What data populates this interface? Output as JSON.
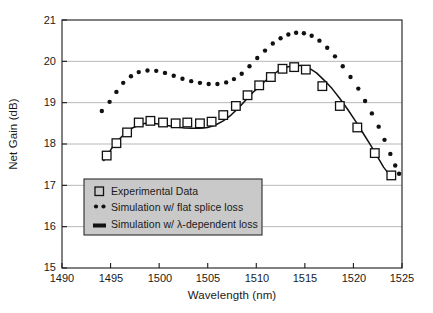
{
  "chart_data": {
    "type": "line",
    "title": "",
    "xlabel": "Wavelength (nm)",
    "ylabel": "Net Gain (dB)",
    "xlim": [
      1490,
      1525
    ],
    "ylim": [
      15,
      21
    ],
    "xticks": [
      1490,
      1495,
      1500,
      1505,
      1510,
      1515,
      1520,
      1525
    ],
    "yticks": [
      15,
      16,
      17,
      18,
      19,
      20,
      21
    ],
    "grid": "horizontal",
    "legend_position": "lower-left-inside",
    "series": [
      {
        "name": "Experimental Data",
        "marker": "open-square",
        "style": "markers",
        "points": [
          [
            1494.6,
            17.72
          ],
          [
            1495.6,
            18.02
          ],
          [
            1496.7,
            18.28
          ],
          [
            1497.9,
            18.52
          ],
          [
            1499.1,
            18.56
          ],
          [
            1500.4,
            18.52
          ],
          [
            1501.7,
            18.5
          ],
          [
            1502.9,
            18.52
          ],
          [
            1504.2,
            18.5
          ],
          [
            1505.4,
            18.54
          ],
          [
            1506.6,
            18.7
          ],
          [
            1507.9,
            18.92
          ],
          [
            1509.1,
            19.18
          ],
          [
            1510.3,
            19.42
          ],
          [
            1511.5,
            19.62
          ],
          [
            1512.7,
            19.82
          ],
          [
            1513.9,
            19.86
          ],
          [
            1515.1,
            19.8
          ],
          [
            1516.8,
            19.4
          ],
          [
            1518.6,
            18.92
          ],
          [
            1520.4,
            18.4
          ],
          [
            1522.2,
            17.78
          ],
          [
            1523.9,
            17.24
          ]
        ]
      },
      {
        "name": "Simulation w/ flat splice loss",
        "marker": "dot",
        "style": "dotted",
        "points": [
          [
            1494.1,
            18.8
          ],
          [
            1494.9,
            19.02
          ],
          [
            1495.6,
            19.26
          ],
          [
            1496.3,
            19.48
          ],
          [
            1497.1,
            19.64
          ],
          [
            1497.9,
            19.74
          ],
          [
            1498.8,
            19.78
          ],
          [
            1499.7,
            19.77
          ],
          [
            1500.6,
            19.72
          ],
          [
            1501.5,
            19.65
          ],
          [
            1502.4,
            19.58
          ],
          [
            1503.3,
            19.52
          ],
          [
            1504.2,
            19.48
          ],
          [
            1505.1,
            19.45
          ],
          [
            1506.0,
            19.45
          ],
          [
            1506.9,
            19.49
          ],
          [
            1507.7,
            19.57
          ],
          [
            1508.5,
            19.7
          ],
          [
            1509.3,
            19.88
          ],
          [
            1510.1,
            20.08
          ],
          [
            1510.9,
            20.26
          ],
          [
            1511.7,
            20.43
          ],
          [
            1512.5,
            20.56
          ],
          [
            1513.3,
            20.65
          ],
          [
            1514.1,
            20.69
          ],
          [
            1514.9,
            20.68
          ],
          [
            1515.7,
            20.62
          ],
          [
            1516.5,
            20.5
          ],
          [
            1517.3,
            20.33
          ],
          [
            1518.1,
            20.12
          ],
          [
            1518.9,
            19.88
          ],
          [
            1519.7,
            19.62
          ],
          [
            1520.5,
            19.34
          ],
          [
            1521.2,
            19.04
          ],
          [
            1521.9,
            18.74
          ],
          [
            1522.6,
            18.42
          ],
          [
            1523.2,
            18.1
          ],
          [
            1523.8,
            17.76
          ],
          [
            1524.3,
            17.48
          ],
          [
            1524.7,
            17.28
          ]
        ]
      },
      {
        "name": "Simulation w/ λ-dependent loss",
        "marker": "none",
        "style": "solid",
        "points": [
          [
            1494.3,
            17.6
          ],
          [
            1494.8,
            17.78
          ],
          [
            1495.3,
            17.96
          ],
          [
            1495.9,
            18.12
          ],
          [
            1496.5,
            18.26
          ],
          [
            1497.2,
            18.38
          ],
          [
            1497.9,
            18.46
          ],
          [
            1498.6,
            18.5
          ],
          [
            1499.4,
            18.5
          ],
          [
            1500.2,
            18.47
          ],
          [
            1501.0,
            18.44
          ],
          [
            1501.8,
            18.41
          ],
          [
            1502.6,
            18.39
          ],
          [
            1503.4,
            18.38
          ],
          [
            1504.2,
            18.38
          ],
          [
            1505.0,
            18.4
          ],
          [
            1505.8,
            18.46
          ],
          [
            1506.6,
            18.56
          ],
          [
            1507.4,
            18.7
          ],
          [
            1508.2,
            18.88
          ],
          [
            1509.0,
            19.08
          ],
          [
            1509.8,
            19.28
          ],
          [
            1510.6,
            19.46
          ],
          [
            1511.4,
            19.62
          ],
          [
            1512.2,
            19.76
          ],
          [
            1513.0,
            19.85
          ],
          [
            1513.8,
            19.9
          ],
          [
            1514.6,
            19.9
          ],
          [
            1515.4,
            19.84
          ],
          [
            1516.2,
            19.72
          ],
          [
            1517.0,
            19.54
          ],
          [
            1517.8,
            19.34
          ],
          [
            1518.6,
            19.1
          ],
          [
            1519.4,
            18.84
          ],
          [
            1520.2,
            18.56
          ],
          [
            1521.0,
            18.26
          ],
          [
            1521.8,
            17.96
          ],
          [
            1522.5,
            17.68
          ],
          [
            1523.1,
            17.44
          ],
          [
            1523.7,
            17.26
          ],
          [
            1524.1,
            17.18
          ]
        ]
      }
    ]
  },
  "legend": {
    "items": [
      {
        "label": "Experimental Data",
        "marker": "open-square"
      },
      {
        "label": "Simulation w/ flat splice loss",
        "marker": "dot"
      },
      {
        "label": "Simulation w/ λ-dependent loss",
        "marker": "solid-bar"
      }
    ],
    "background_color": "#c9c9c9"
  },
  "colors": {
    "axis": "#1a1a1a",
    "grid": "#b0b0b0",
    "data": "#111111"
  }
}
